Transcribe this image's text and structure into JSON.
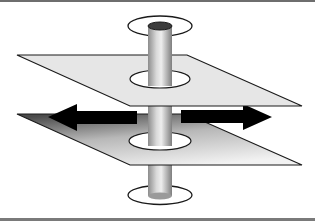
{
  "diagram": {
    "colors": {
      "background": "#ffffff",
      "frame_border": "#707070",
      "upper_plane_fill": "#e6e6e6",
      "lower_plane_gradient_start": "#4a4a4a",
      "lower_plane_gradient_end": "#f0f0f0",
      "rod_dark": "#8a8a8a",
      "rod_light": "#e8e8e8",
      "arrow_fill": "#000000",
      "rod_cap": "#3c3c3c",
      "outline": "#1a1a1a"
    },
    "elements": [
      {
        "id": "top-washer",
        "shape": "ellipse"
      },
      {
        "id": "rod",
        "shape": "cylinder"
      },
      {
        "id": "upper-plane",
        "shape": "parallelogram"
      },
      {
        "id": "lower-plane",
        "shape": "parallelogram"
      },
      {
        "id": "left-arrow",
        "shape": "arrow",
        "direction": "left"
      },
      {
        "id": "right-arrow",
        "shape": "arrow",
        "direction": "right"
      },
      {
        "id": "bottom-washer",
        "shape": "ellipse"
      }
    ]
  }
}
